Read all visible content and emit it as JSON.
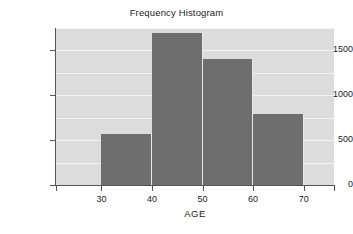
{
  "chart_data": {
    "type": "bar",
    "title": "Frequency Histogram",
    "xlabel": "AGE",
    "ylabel": "",
    "bin_edges": [
      30,
      40,
      50,
      60,
      70
    ],
    "categories": [
      "30-40",
      "40-50",
      "50-60",
      "60-70"
    ],
    "values": [
      570,
      1700,
      1410,
      790
    ],
    "bars": [
      {
        "label": "30-40",
        "start": 30,
        "end": 40,
        "value": 570
      },
      {
        "label": "40-50",
        "start": 40,
        "end": 50,
        "value": 1700
      },
      {
        "label": "50-60",
        "start": 50,
        "end": 60,
        "value": 1410
      },
      {
        "label": "60-70",
        "start": 60,
        "end": 70,
        "value": 790
      }
    ],
    "xlim": [
      21,
      76
    ],
    "ylim": [
      0,
      1750
    ],
    "x_ticks": [
      30,
      40,
      50,
      60,
      70
    ],
    "x_tick_labels": [
      "30",
      "40",
      "50",
      "60",
      "70"
    ],
    "y_ticks": [
      0,
      500,
      1000,
      1500
    ],
    "y_tick_labels": [
      "0",
      "500",
      "1000",
      "1500"
    ],
    "gridlines": [
      250,
      500,
      750,
      1000,
      1250,
      1500,
      1750
    ],
    "grid": true,
    "legend": "none",
    "colors": {
      "bar": "#6e6e6e",
      "plot_background": "#dcdcdc",
      "gridline": "#f2f2f2",
      "axis": "#555555",
      "text": "#1c1c1c",
      "page_background": "#ffffff"
    }
  }
}
